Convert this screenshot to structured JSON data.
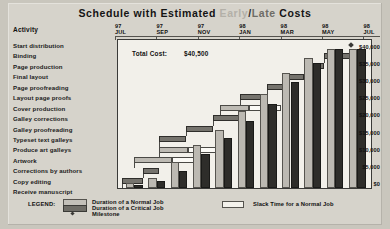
{
  "title": {
    "part1": "Schedule with Estimated",
    "early": "Early",
    "slash": "/",
    "late": "Late",
    "part2": "Costs",
    "early_color": "#b3b0a8",
    "late_color": "#6e6c66"
  },
  "activity_header": "Activity",
  "total_cost": {
    "label": "Total Cost:",
    "value": "$40,500"
  },
  "time_axis": {
    "ticks": [
      {
        "year": "97",
        "month": "JUL"
      },
      {
        "year": "97",
        "month": "SEP"
      },
      {
        "year": "97",
        "month": "NOV"
      },
      {
        "year": "98",
        "month": "JAN"
      },
      {
        "year": "98",
        "month": "MAR"
      },
      {
        "year": "98",
        "month": "MAY"
      },
      {
        "year": "98",
        "month": "JUL"
      }
    ]
  },
  "activities": [
    "Start distribution",
    "Binding",
    "Page production",
    "Final layout",
    "Page proofreading",
    "Layout page proofs",
    "Cover production",
    "Galley corrections",
    "Galley proofreading",
    "Typeset text galleys",
    "Produce art galleys",
    "Artwork",
    "Corrections by authors",
    "Copy editing",
    "Receive manuscript"
  ],
  "legend": {
    "title": "LEGEND:",
    "items": [
      {
        "swatch": "normal",
        "label": "Duration of a Normal Job"
      },
      {
        "swatch": "critical",
        "label": "Duration of a Critical Job"
      },
      {
        "swatch": "milestone",
        "label": "Milestone"
      },
      {
        "swatch": "slack",
        "label": "Slack Time for a Normal Job"
      }
    ]
  },
  "chart_data": {
    "type": "bar",
    "title": "Schedule with Estimated Early/Late Costs",
    "xlabel": "",
    "ylabel": "Cumulative Cost",
    "ylim": [
      0,
      42000
    ],
    "grid": false,
    "legend_position": "bottom",
    "y_ticks": [
      "$0",
      "$5,000",
      "$10,000",
      "$15,000",
      "$20,000",
      "$25,000",
      "$30,000",
      "$35,000",
      "$40,000"
    ],
    "y_tick_values": [
      0,
      5000,
      10000,
      15000,
      20000,
      25000,
      30000,
      35000,
      40000
    ],
    "categories": [
      "97 JUL",
      "97 AUG",
      "97 SEP",
      "97 OCT",
      "97 NOV",
      "97 DEC",
      "98 JAN",
      "98 FEB",
      "98 MAR",
      "98 APR",
      "98 MAY"
    ],
    "series": [
      {
        "name": "Early",
        "values": [
          1500,
          3000,
          7500,
          12500,
          17000,
          22500,
          27500,
          33500,
          38000,
          40500,
          40500
        ]
      },
      {
        "name": "Late",
        "values": [
          1000,
          2000,
          5000,
          10000,
          14500,
          19500,
          24500,
          31000,
          36500,
          40500,
          40500
        ]
      }
    ],
    "gantt_tasks": [
      {
        "activity": "Receive manuscript",
        "type": "milestone",
        "start": 0,
        "end": 0
      },
      {
        "activity": "Copy editing",
        "type": "critical",
        "start": 0,
        "end": 18
      },
      {
        "activity": "Corrections by authors",
        "type": "critical",
        "start": 18,
        "end": 32
      },
      {
        "activity": "Artwork",
        "type": "normal",
        "start": 10,
        "end": 44,
        "slack_end": 70
      },
      {
        "activity": "Produce art galleys",
        "type": "normal",
        "start": 32,
        "end": 58,
        "slack_end": 86
      },
      {
        "activity": "Typeset text galleys",
        "type": "critical",
        "start": 32,
        "end": 56
      },
      {
        "activity": "Galley proofreading",
        "type": "critical",
        "start": 56,
        "end": 80
      },
      {
        "activity": "Galley corrections",
        "type": "critical",
        "start": 80,
        "end": 104
      },
      {
        "activity": "Cover production",
        "type": "normal",
        "start": 86,
        "end": 112,
        "slack_end": 140
      },
      {
        "activity": "Layout page proofs",
        "type": "critical",
        "start": 104,
        "end": 128
      },
      {
        "activity": "Page proofreading",
        "type": "critical",
        "start": 128,
        "end": 146
      },
      {
        "activity": "Final layout",
        "type": "critical",
        "start": 146,
        "end": 160
      },
      {
        "activity": "Page production",
        "type": "critical",
        "start": 160,
        "end": 178
      },
      {
        "activity": "Binding",
        "type": "critical",
        "start": 178,
        "end": 202
      },
      {
        "activity": "Start distribution",
        "type": "milestone",
        "start": 202,
        "end": 202
      }
    ]
  }
}
